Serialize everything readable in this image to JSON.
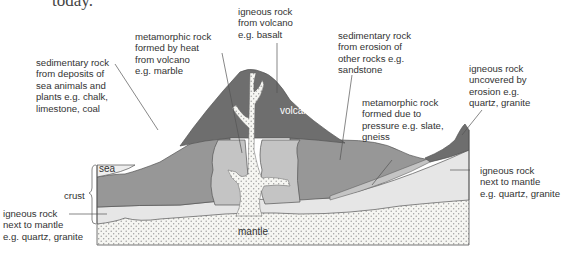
{
  "page_fragment": "today.",
  "diagram": {
    "labels": {
      "igneous_volcano": "igneous rock\nfrom volcano\ne.g. basalt",
      "metamorphic_heat": "metamorphic rock\nformed by heat\nfrom volcano\ne.g. marble",
      "sedimentary_sea": "sedimentary rock\nfrom deposits of\nsea animals and\nplants e.g. chalk,\nlimestone, coal",
      "sedimentary_erosion": "sedimentary rock\nfrom erosion of\nother rocks e.g.\nsandstone",
      "igneous_uncovered": "igneous rock\nuncovered by\nerosion e.g.\nquartz, granite",
      "metamorphic_pressure": "metamorphic rock\nformed due to\npressure e.g. slate,\ngneiss",
      "igneous_mantle_right": "igneous rock\nnext to mantle\ne.g. quartz, granite",
      "igneous_mantle_left": "igneous rock\nnext to mantle\ne.g. quartz, granite",
      "crust": "crust",
      "sea": "sea",
      "volcano": "volcano",
      "mantle": "mantle"
    },
    "colors": {
      "volcano": "#6e6e6e",
      "sedimentary": "#979797",
      "metamorphic": "#c4c4c4",
      "igneous_crust": "#e6e6e6",
      "mantle": "#f4f4f0",
      "sea": "#ededed",
      "outline": "#555555"
    }
  }
}
